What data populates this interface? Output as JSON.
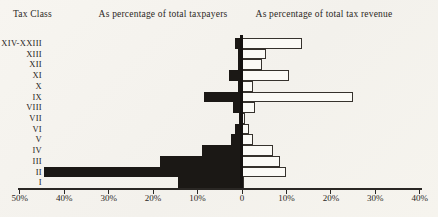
{
  "page": {
    "background_color": "#f5f3ee",
    "ink_color": "#262320"
  },
  "chart_data": {
    "type": "bar",
    "variant": "diverging-horizontal (population-pyramid style)",
    "y_axis_title": "Tax Class",
    "title_left": "As percentage of total taxpayers",
    "title_right": "As percentage of total tax revenue",
    "categories": [
      "XIV-XXIII",
      "XIII",
      "XII",
      "XI",
      "X",
      "IX",
      "VIII",
      "VII",
      "VI",
      "V",
      "IV",
      "III",
      "II",
      "I"
    ],
    "series": [
      {
        "name": "As percentage of total taxpayers",
        "side": "left",
        "style": "solid-black",
        "fill": "#1b1815",
        "values": [
          1.5,
          1.0,
          1.0,
          3.0,
          1.0,
          8.5,
          2.0,
          0.7,
          1.5,
          2.5,
          9.0,
          18.5,
          44.5,
          14.5
        ]
      },
      {
        "name": "As percentage of total tax revenue",
        "side": "right",
        "style": "white-outlined",
        "fill": "#fbfaf6",
        "stroke": "#36322d",
        "values": [
          13.5,
          5.5,
          4.5,
          10.5,
          2.5,
          25.0,
          3.0,
          0.7,
          1.5,
          2.5,
          7.0,
          8.5,
          10.0,
          0.3
        ]
      }
    ],
    "x_axis": {
      "left_max": 50,
      "right_max": 40,
      "tick_interval": 10,
      "grid": false,
      "ticks": [
        {
          "label": "50%",
          "value": -50
        },
        {
          "label": "40%",
          "value": -40
        },
        {
          "label": "30%",
          "value": -30
        },
        {
          "label": "20%",
          "value": -20
        },
        {
          "label": "10%",
          "value": -10
        },
        {
          "label": "0",
          "value": 0
        },
        {
          "label": "10%",
          "value": 10
        },
        {
          "label": "20%",
          "value": 20
        },
        {
          "label": "30%",
          "value": 30
        },
        {
          "label": "40%",
          "value": 40
        }
      ]
    }
  }
}
